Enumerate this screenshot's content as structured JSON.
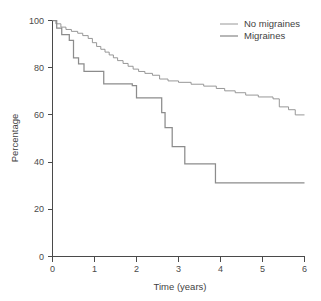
{
  "chart_data": {
    "type": "line",
    "subtype": "kaplan-meier-step",
    "title": "",
    "xlabel": "Time (years)",
    "ylabel": "Percentage",
    "xlim": [
      0,
      6
    ],
    "ylim": [
      0,
      100
    ],
    "xticks": [
      0,
      1,
      2,
      3,
      4,
      5,
      6
    ],
    "yticks": [
      0,
      20,
      40,
      60,
      80,
      100
    ],
    "xtick_labels": [
      "0",
      "1",
      "2",
      "3",
      "4",
      "5",
      "6"
    ],
    "ytick_labels": [
      "0",
      "20",
      "40",
      "60",
      "80",
      "100"
    ],
    "grid": false,
    "legend_position": "top-right",
    "colors": {
      "no_migraines": "#8c8c8c",
      "migraines": "#8c8c8c",
      "axis": "#4a4a4a",
      "text": "#3f3f3f",
      "background": "#ffffff"
    },
    "series": [
      {
        "name": "No migraines",
        "line_width": 0.9,
        "color": "#8c8c8c",
        "points": [
          [
            0.0,
            100.0
          ],
          [
            0.08,
            100.0
          ],
          [
            0.08,
            98.6
          ],
          [
            0.2,
            98.6
          ],
          [
            0.2,
            97.2
          ],
          [
            0.32,
            97.2
          ],
          [
            0.32,
            96.2
          ],
          [
            0.45,
            96.2
          ],
          [
            0.45,
            95.4
          ],
          [
            0.6,
            95.4
          ],
          [
            0.6,
            94.6
          ],
          [
            0.72,
            94.6
          ],
          [
            0.72,
            93.6
          ],
          [
            0.85,
            93.6
          ],
          [
            0.85,
            92.4
          ],
          [
            0.95,
            92.4
          ],
          [
            0.95,
            90.6
          ],
          [
            1.05,
            90.6
          ],
          [
            1.05,
            89.0
          ],
          [
            1.15,
            89.0
          ],
          [
            1.15,
            87.8
          ],
          [
            1.25,
            87.8
          ],
          [
            1.25,
            86.6
          ],
          [
            1.35,
            86.6
          ],
          [
            1.35,
            85.4
          ],
          [
            1.45,
            85.4
          ],
          [
            1.45,
            84.2
          ],
          [
            1.55,
            84.2
          ],
          [
            1.55,
            83.0
          ],
          [
            1.68,
            83.0
          ],
          [
            1.68,
            81.8
          ],
          [
            1.8,
            81.8
          ],
          [
            1.8,
            80.6
          ],
          [
            1.92,
            80.6
          ],
          [
            1.92,
            79.4
          ],
          [
            2.05,
            79.4
          ],
          [
            2.05,
            78.4
          ],
          [
            2.2,
            78.4
          ],
          [
            2.2,
            77.6
          ],
          [
            2.38,
            77.6
          ],
          [
            2.38,
            76.8
          ],
          [
            2.55,
            76.8
          ],
          [
            2.55,
            75.2
          ],
          [
            2.75,
            75.2
          ],
          [
            2.75,
            74.4
          ],
          [
            3.0,
            74.4
          ],
          [
            3.0,
            73.8
          ],
          [
            3.3,
            73.8
          ],
          [
            3.3,
            73.0
          ],
          [
            3.6,
            73.0
          ],
          [
            3.6,
            72.2
          ],
          [
            3.9,
            72.2
          ],
          [
            3.9,
            71.2
          ],
          [
            4.1,
            71.2
          ],
          [
            4.1,
            70.2
          ],
          [
            4.35,
            70.2
          ],
          [
            4.35,
            69.4
          ],
          [
            4.6,
            69.4
          ],
          [
            4.6,
            68.4
          ],
          [
            4.9,
            68.4
          ],
          [
            4.9,
            67.6
          ],
          [
            5.25,
            67.6
          ],
          [
            5.25,
            66.8
          ],
          [
            5.4,
            66.8
          ],
          [
            5.4,
            63.4
          ],
          [
            5.62,
            63.4
          ],
          [
            5.62,
            62.2
          ],
          [
            5.78,
            62.2
          ],
          [
            5.78,
            60.0
          ],
          [
            6.0,
            60.0
          ]
        ]
      },
      {
        "name": "Migraines",
        "line_width": 1.25,
        "color": "#8c8c8c",
        "points": [
          [
            0.0,
            100.0
          ],
          [
            0.1,
            100.0
          ],
          [
            0.1,
            96.8
          ],
          [
            0.22,
            96.8
          ],
          [
            0.22,
            94.0
          ],
          [
            0.4,
            94.0
          ],
          [
            0.4,
            91.6
          ],
          [
            0.5,
            91.6
          ],
          [
            0.5,
            84.2
          ],
          [
            0.62,
            84.2
          ],
          [
            0.62,
            81.6
          ],
          [
            0.75,
            81.6
          ],
          [
            0.75,
            78.4
          ],
          [
            1.22,
            78.4
          ],
          [
            1.22,
            73.2
          ],
          [
            1.9,
            73.2
          ],
          [
            1.9,
            72.4
          ],
          [
            2.0,
            72.4
          ],
          [
            2.0,
            67.2
          ],
          [
            2.6,
            67.2
          ],
          [
            2.6,
            61.0
          ],
          [
            2.68,
            61.0
          ],
          [
            2.68,
            54.6
          ],
          [
            2.85,
            54.6
          ],
          [
            2.85,
            46.6
          ],
          [
            3.15,
            46.6
          ],
          [
            3.15,
            39.2
          ],
          [
            3.88,
            39.2
          ],
          [
            3.88,
            31.2
          ],
          [
            6.0,
            31.2
          ]
        ]
      }
    ]
  },
  "legend": {
    "entries": [
      {
        "label": "No migraines",
        "key": "no_migraines"
      },
      {
        "label": "Migraines",
        "key": "migraines"
      }
    ]
  },
  "axes": {
    "x_title": "Time (years)",
    "y_title": "Percentage",
    "x_tick_0": "0",
    "x_tick_1": "1",
    "x_tick_2": "2",
    "x_tick_3": "3",
    "x_tick_4": "4",
    "x_tick_5": "5",
    "x_tick_6": "6",
    "y_tick_0": "0",
    "y_tick_20": "20",
    "y_tick_40": "40",
    "y_tick_60": "60",
    "y_tick_80": "80",
    "y_tick_100": "100"
  }
}
